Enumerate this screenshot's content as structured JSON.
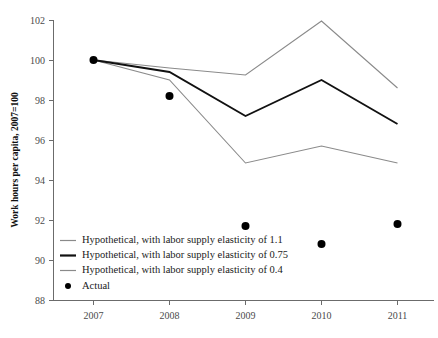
{
  "chart_data": {
    "type": "line",
    "title": "",
    "xlabel": "",
    "ylabel": "Work hours per capita, 2007=100",
    "x": [
      2007,
      2008,
      2009,
      2010,
      2011
    ],
    "xticklabels": [
      "2007",
      "2008",
      "2009",
      "2010",
      "2011"
    ],
    "yticklabels": [
      "88",
      "90",
      "92",
      "94",
      "96",
      "98",
      "100",
      "102"
    ],
    "yticks": [
      88,
      90,
      92,
      94,
      96,
      98,
      100,
      102
    ],
    "ylim": [
      88,
      102
    ],
    "xlim": [
      2006.6,
      2011.4
    ],
    "grid": false,
    "legend_position": "lower-left-inside",
    "series": [
      {
        "name": "Hypothetical, with labor supply elasticity of 1.1",
        "marker": "none",
        "style": "thin-gray",
        "color": "#8a8a8a",
        "values": [
          100.0,
          99.6,
          99.25,
          101.95,
          98.6
        ]
      },
      {
        "name": "Hypothetical, with labor supply elasticity of 0.75",
        "marker": "none",
        "style": "thick-black",
        "color": "#111111",
        "values": [
          100.0,
          99.4,
          97.2,
          99.0,
          96.8
        ]
      },
      {
        "name": "Hypothetical, with labor supply elasticity of 0.4",
        "marker": "none",
        "style": "thin-gray",
        "color": "#8a8a8a",
        "values": [
          100.0,
          99.0,
          94.85,
          95.7,
          94.85
        ]
      },
      {
        "name": "Actual",
        "marker": "dot",
        "style": "black-dots",
        "color": "#000000",
        "values": [
          100.0,
          98.2,
          91.7,
          90.8,
          91.8
        ]
      }
    ],
    "legend_entries": [
      {
        "label": "Hypothetical, with labor supply elasticity of 1.1",
        "swatch": "thin-line",
        "color": "#8a8a8a"
      },
      {
        "label": "Hypothetical, with labor supply elasticity of 0.75",
        "swatch": "thick-line",
        "color": "#111111"
      },
      {
        "label": "Hypothetical, with labor supply elasticity of 0.4",
        "swatch": "thin-line",
        "color": "#8a8a8a"
      },
      {
        "label": "Actual",
        "swatch": "dot",
        "color": "#000000"
      }
    ]
  }
}
